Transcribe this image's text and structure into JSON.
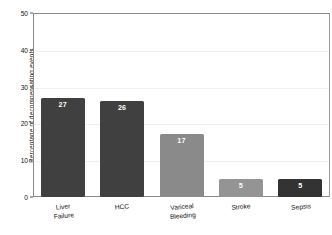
{
  "chart_data": {
    "type": "bar",
    "title": "",
    "xlabel": "",
    "ylabel": "Percentage of decompensating events",
    "categories": [
      "Liver\nFailure",
      "HCC",
      "Variceal\nBleeding",
      "Stroke",
      "Sepsis"
    ],
    "values": [
      27,
      26,
      17,
      5,
      5
    ],
    "value_labels": [
      "27",
      "26",
      "17",
      "5",
      "5"
    ],
    "bar_colors": [
      "#404040",
      "#404040",
      "#8a8a8a",
      "#949494",
      "#333333"
    ],
    "ylim": [
      0,
      50
    ],
    "yticks": [
      0,
      10,
      20,
      30,
      40,
      50
    ],
    "ytick_labels": [
      "0",
      "10",
      "20",
      "30",
      "40",
      "50"
    ],
    "grid": true,
    "legend": "none",
    "value_label_color": "#ffffff",
    "frame_color": "#8a8a8a",
    "background": "#ffffff"
  }
}
